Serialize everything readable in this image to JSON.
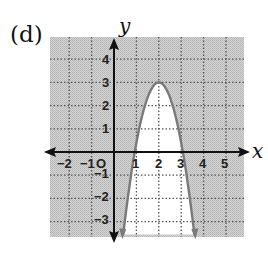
{
  "figure": {
    "label": "(d)",
    "x_axis_label": "x",
    "y_axis_label": "y",
    "origin_label": "O",
    "x_tick_labels": [
      "−2",
      "−1",
      "1",
      "2",
      "3",
      "4",
      "5"
    ],
    "y_tick_labels": [
      "4",
      "3",
      "2",
      "1",
      "−1",
      "−2",
      "−3"
    ],
    "colors": {
      "shading": "#c9c9c9",
      "grid": "#555555",
      "axes": "#111111",
      "curve": "#7a7a7a",
      "background": "#ffffff"
    }
  },
  "chart_data": {
    "type": "region",
    "title": "(d)",
    "xlabel": "x",
    "ylabel": "y",
    "xlim": [
      -2.8,
      5.8
    ],
    "ylim": [
      -3.7,
      4.9
    ],
    "x_ticks": [
      -2,
      -1,
      0,
      1,
      2,
      3,
      4,
      5
    ],
    "y_ticks": [
      -3,
      -2,
      -1,
      0,
      1,
      2,
      3,
      4
    ],
    "grid": "dotted",
    "curve": {
      "kind": "parabola",
      "vertex": [
        2,
        3
      ],
      "opens": "down",
      "approx_points": [
        [
          0.5,
          -3
        ],
        [
          0.95,
          0
        ],
        [
          1.15,
          1
        ],
        [
          2,
          3
        ],
        [
          2.85,
          1
        ],
        [
          3.2,
          0
        ],
        [
          3.8,
          -3
        ]
      ],
      "line_style": "solid"
    },
    "shaded_region": "outside parabola (above/around the curve)",
    "unshaded_region": "inside parabola (below vertex, between arms)"
  }
}
